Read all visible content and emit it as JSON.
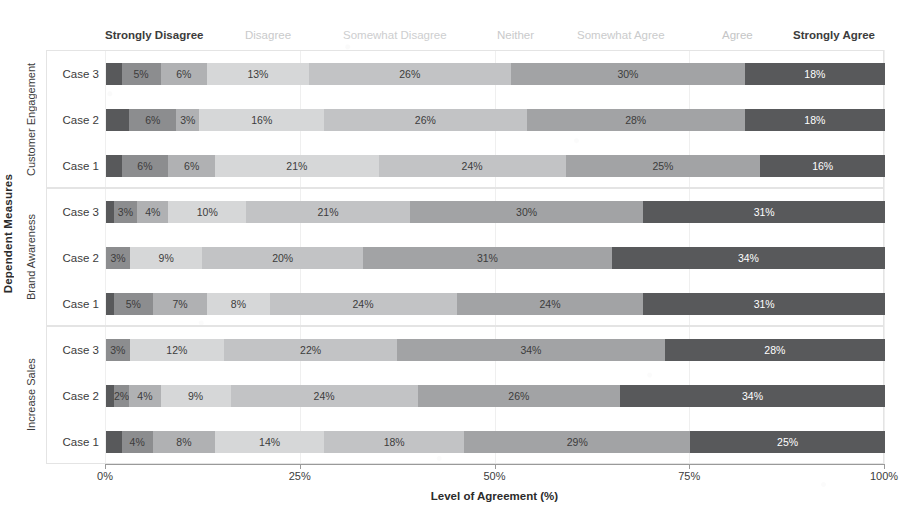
{
  "chart_data": {
    "type": "bar",
    "subtype": "stacked-horizontal-diverging-likert",
    "title": "",
    "xlabel": "Level of Agreement (%)",
    "ylabel": "Dependent Measures",
    "xlim": [
      0,
      100
    ],
    "xtick_labels": [
      "0%",
      "25%",
      "50%",
      "75%",
      "100%"
    ],
    "xtick_values": [
      0,
      25,
      50,
      75,
      100
    ],
    "grid": true,
    "legend_position": "top",
    "legend_entries": [
      "Strongly Disagree",
      "Disagree",
      "Somewhat Disagree",
      "Neither",
      "Somewhat Agree",
      "Agree",
      "Strongly Agree"
    ],
    "series_colors": [
      "#58595b",
      "#8c8d8f",
      "#b0b1b3",
      "#d6d7d8",
      "#c2c3c5",
      "#a2a3a5",
      "#58595b"
    ],
    "series_label_colors": [
      "#ffffff",
      "#3c3c3c",
      "#3c3c3c",
      "#3c3c3c",
      "#3c3c3c",
      "#3c3c3c",
      "#ffffff"
    ],
    "groups": [
      {
        "name": "Customer Engagement",
        "rows": [
          {
            "label": "Case 3",
            "values": [
              2,
              5,
              6,
              13,
              26,
              30,
              18
            ],
            "labels": [
              "",
              "5%",
              "6%",
              "13%",
              "26%",
              "30%",
              "18%"
            ]
          },
          {
            "label": "Case 2",
            "values": [
              3,
              6,
              3,
              16,
              26,
              28,
              18
            ],
            "labels": [
              "",
              "6%",
              "3%",
              "16%",
              "26%",
              "28%",
              "18%"
            ]
          },
          {
            "label": "Case 1",
            "values": [
              2,
              6,
              6,
              21,
              24,
              25,
              16
            ],
            "labels": [
              "",
              "6%",
              "6%",
              "21%",
              "24%",
              "25%",
              "16%"
            ]
          }
        ]
      },
      {
        "name": "Brand Awareness",
        "rows": [
          {
            "label": "Case 3",
            "values": [
              1,
              3,
              4,
              10,
              21,
              30,
              31
            ],
            "labels": [
              "",
              "3%",
              "4%",
              "10%",
              "21%",
              "30%",
              "31%"
            ]
          },
          {
            "label": "Case 2",
            "values": [
              0,
              3,
              0,
              9,
              20,
              31,
              34
            ],
            "labels": [
              "",
              "3%",
              "",
              "9%",
              "20%",
              "31%",
              "34%"
            ]
          },
          {
            "label": "Case 1",
            "values": [
              1,
              5,
              7,
              8,
              24,
              24,
              31
            ],
            "labels": [
              "",
              "5%",
              "7%",
              "8%",
              "24%",
              "24%",
              "31%"
            ]
          }
        ]
      },
      {
        "name": "Increase Sales",
        "rows": [
          {
            "label": "Case 3",
            "values": [
              0,
              3,
              0,
              12,
              22,
              34,
              28
            ],
            "labels": [
              "",
              "3%",
              "",
              "12%",
              "22%",
              "34%",
              "28%"
            ]
          },
          {
            "label": "Case 2",
            "values": [
              1,
              2,
              4,
              9,
              24,
              26,
              34
            ],
            "labels": [
              "",
              "2%",
              "4%",
              "9%",
              "24%",
              "26%",
              "34%"
            ]
          },
          {
            "label": "Case 1",
            "values": [
              2,
              4,
              8,
              14,
              18,
              29,
              25
            ],
            "labels": [
              "",
              "4%",
              "8%",
              "14%",
              "18%",
              "29%",
              "25%"
            ]
          }
        ]
      }
    ]
  },
  "legend": {
    "items": [
      {
        "label": "Strongly Disagree",
        "left": 0,
        "color": "#3c3c3c",
        "weight": "bold"
      },
      {
        "label": "Disagree",
        "left": 140,
        "color": "#c9cacb",
        "weight": "normal"
      },
      {
        "label": "Somewhat Disagree",
        "left": 238,
        "color": "#cdcecf",
        "weight": "normal"
      },
      {
        "label": "Neither",
        "left": 392,
        "color": "#c9cacb",
        "weight": "normal"
      },
      {
        "label": "Somewhat Agree",
        "left": 472,
        "color": "#cacbcc",
        "weight": "normal"
      },
      {
        "label": "Agree",
        "left": 617,
        "color": "#c4c5c6",
        "weight": "normal"
      },
      {
        "label": "Strongly Agree",
        "left": 688,
        "color": "#3c3c3c",
        "weight": "bold"
      }
    ]
  },
  "axes": {
    "y_title": "Dependent Measures",
    "x_title": "Level of Agreement (%)"
  }
}
